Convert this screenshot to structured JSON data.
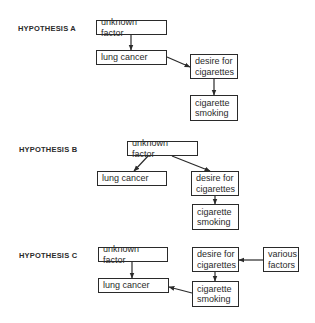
{
  "hypotheses": [
    {
      "label": "HYPOTHESIS A",
      "label_pos": [
        18,
        24
      ],
      "boxes": [
        {
          "id": "a_unknown",
          "text": "unknown factor",
          "x": 96,
          "y": 20,
          "w": 71,
          "h": 15
        },
        {
          "id": "a_lung",
          "text": "lung cancer",
          "x": 96,
          "y": 50,
          "w": 71,
          "h": 15
        },
        {
          "id": "a_desire",
          "text": "desire for\ncigarettes",
          "x": 190,
          "y": 54,
          "w": 48,
          "h": 25
        },
        {
          "id": "a_smoking",
          "text": "cigarette\nsmoking",
          "x": 190,
          "y": 95,
          "w": 48,
          "h": 26
        }
      ],
      "arrows": [
        {
          "from": "unknown factor",
          "to": "lung cancer",
          "x1": 131,
          "y1": 35,
          "x2": 131,
          "y2": 50
        },
        {
          "from": "lung cancer",
          "to": "desire for cigarettes",
          "x1": 167,
          "y1": 57,
          "x2": 190,
          "y2": 67
        },
        {
          "from": "desire for cigarettes",
          "to": "cigarette smoking",
          "x1": 214,
          "y1": 79,
          "x2": 214,
          "y2": 95
        }
      ]
    },
    {
      "label": "HYPOTHESIS B",
      "label_pos": [
        19,
        145
      ],
      "boxes": [
        {
          "id": "b_unknown",
          "text": "unknown factor",
          "x": 127,
          "y": 141,
          "w": 71,
          "h": 15
        },
        {
          "id": "b_lung",
          "text": "lung cancer",
          "x": 97,
          "y": 171,
          "w": 70,
          "h": 15
        },
        {
          "id": "b_desire",
          "text": "desire for\ncigarettes",
          "x": 191,
          "y": 171,
          "w": 48,
          "h": 25
        },
        {
          "id": "b_smoking",
          "text": "cigarette\nsmoking",
          "x": 192,
          "y": 204,
          "w": 47,
          "h": 26
        }
      ],
      "arrows": [
        {
          "from": "unknown factor",
          "to": "lung cancer",
          "x1": 148,
          "y1": 156,
          "x2": 134,
          "y2": 171
        },
        {
          "from": "unknown factor",
          "to": "desire for cigarettes",
          "x1": 172,
          "y1": 156,
          "x2": 210,
          "y2": 171
        },
        {
          "from": "desire for cigarettes",
          "to": "cigarette smoking",
          "x1": 215,
          "y1": 196,
          "x2": 215,
          "y2": 204
        }
      ]
    },
    {
      "label": "HYPOTHESIS C",
      "label_pos": [
        19,
        251
      ],
      "boxes": [
        {
          "id": "c_unknown",
          "text": "unknown factor",
          "x": 98,
          "y": 247,
          "w": 70,
          "h": 15
        },
        {
          "id": "c_lung",
          "text": "lung cancer",
          "x": 98,
          "y": 278,
          "w": 71,
          "h": 15
        },
        {
          "id": "c_desire",
          "text": "desire for\ncigarettes",
          "x": 192,
          "y": 247,
          "w": 47,
          "h": 25
        },
        {
          "id": "c_smoking",
          "text": "cigarette\nsmoking",
          "x": 192,
          "y": 281,
          "w": 47,
          "h": 26
        },
        {
          "id": "c_various",
          "text": "various\nfactors",
          "x": 263,
          "y": 247,
          "w": 36,
          "h": 25
        }
      ],
      "arrows": [
        {
          "from": "unknown factor",
          "to": "lung cancer",
          "x1": 132,
          "y1": 262,
          "x2": 132,
          "y2": 278
        },
        {
          "from": "various factors",
          "to": "desire for cigarettes",
          "x1": 263,
          "y1": 260,
          "x2": 239,
          "y2": 260
        },
        {
          "from": "desire for cigarettes",
          "to": "cigarette smoking",
          "x1": 215,
          "y1": 272,
          "x2": 215,
          "y2": 281
        },
        {
          "from": "cigarette smoking",
          "to": "lung cancer",
          "x1": 192,
          "y1": 293,
          "x2": 169,
          "y2": 287
        }
      ]
    }
  ]
}
